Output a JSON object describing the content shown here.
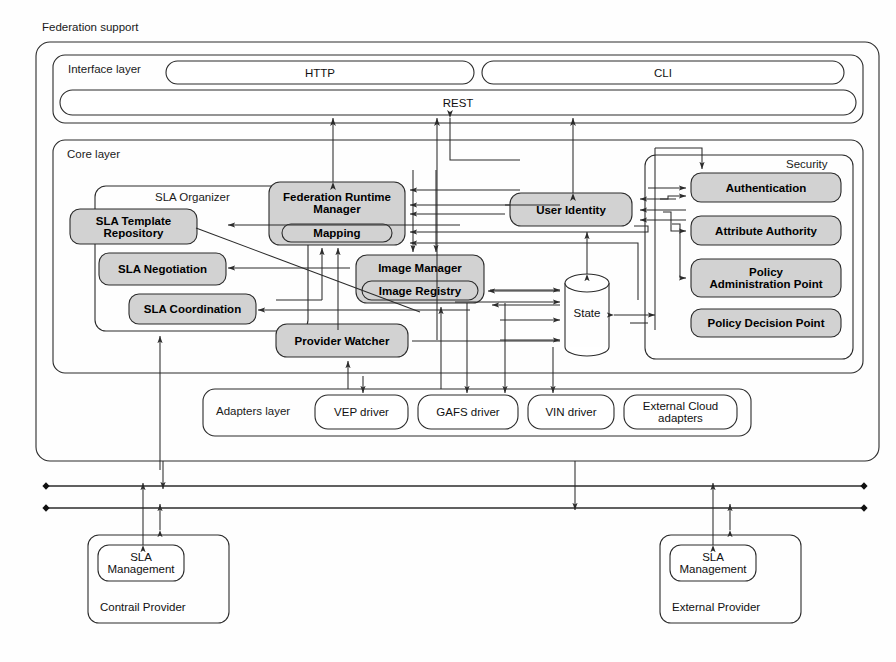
{
  "diagram": {
    "title": "Federation support",
    "interface_layer": {
      "label": "Interface layer",
      "items": [
        {
          "label": "HTTP"
        },
        {
          "label": "CLI"
        },
        {
          "label": "REST"
        }
      ]
    },
    "core_layer": {
      "label": "Core layer",
      "sla_organizer": {
        "label": "SLA Organizer",
        "items": [
          {
            "label": "SLA Template\nRepository"
          },
          {
            "label": "SLA Negotiation"
          },
          {
            "label": "SLA Coordination"
          }
        ]
      },
      "federation_runtime_manager": {
        "label": "Federation Runtime\nManager",
        "sub": "Mapping"
      },
      "image_manager": {
        "label": "Image Manager",
        "sub": "Image Registry"
      },
      "provider_watcher": {
        "label": "Provider Watcher"
      },
      "user_identity": {
        "label": "User Identity"
      },
      "state": {
        "label": "State"
      },
      "security": {
        "label": "Security",
        "items": [
          {
            "label": "Authentication"
          },
          {
            "label": "Attribute Authority"
          },
          {
            "label": "Policy\nAdministration Point"
          },
          {
            "label": "Policy Decision Point"
          }
        ]
      }
    },
    "adapters_layer": {
      "label": "Adapters layer",
      "items": [
        {
          "label": "VEP driver"
        },
        {
          "label": "GAFS driver"
        },
        {
          "label": "VIN driver"
        },
        {
          "label": "External Cloud\nadapters"
        }
      ]
    },
    "providers": [
      {
        "name": "Contrail Provider",
        "component": "SLA\nManagement"
      },
      {
        "name": "External Provider",
        "component": "SLA\nManagement"
      }
    ],
    "colors": {
      "shaded_fill": "#d2d2d2",
      "plain_fill": "#ffffff",
      "stroke": "#2b2b2b",
      "text": "#000000"
    }
  }
}
